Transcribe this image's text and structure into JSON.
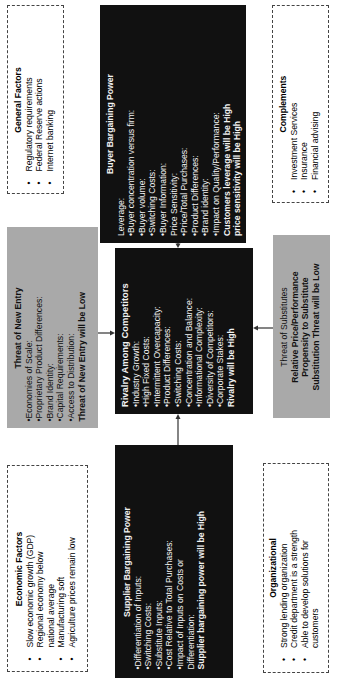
{
  "orientation": "rotated 90° clockwise; text reads bottom-to-top",
  "general_factors": {
    "title": "General Factors",
    "items": [
      "Regulatory requirements",
      "Federal Reserve actions",
      "Internet banking"
    ]
  },
  "buyer_power": {
    "title": "Buyer Bargaining Power",
    "lines": [
      "Leverage:",
      "•Buyer concentration versus firm:",
      "•Buyer volume:",
      "•Switching Costs:",
      "•Buyer Information:",
      "Price Sensitivity:",
      "•Price/Total Purchases:",
      "•Product Differences:",
      "•Brand identity:",
      "•Impact on Quality/Performance:"
    ],
    "conclusion_1": "Customers leverage will be High",
    "conclusion_2": "price sensitivity will be High"
  },
  "complements": {
    "title": "Complements",
    "items": [
      "Investment Services",
      "Insurance",
      "Financial advising"
    ]
  },
  "new_entry": {
    "title": "Threat of New Entry",
    "lines": [
      "•Economies of Scale:",
      "•Proprietary Product Differences:",
      "•Brand Identity:",
      "•Capital Requirements:",
      "•Access to Distribution:"
    ],
    "conclusion": "Threat of New Entry will be Low"
  },
  "rivalry": {
    "title": "Rivalry Among Competitors",
    "lines": [
      "•Industry Growth:",
      "•High Fixed Costs:",
      "•Intermittent Overcapacity:",
      "•Product Differences:",
      "•Switching Costs:",
      "•Concentration and Balance:",
      "•Informational Complexity:",
      "•Diversity of Competitors:",
      "•Corporate Stakes:"
    ],
    "conclusion": "Rivalry will be High"
  },
  "substitutes": {
    "title": "Threat of Substitutes",
    "line_1": "Relative Price/Performance",
    "line_2": "Propensity to Substitute",
    "conclusion": "Substitution Threat will be Low"
  },
  "economic_factors": {
    "title": "Economic Factors",
    "items": [
      "Slow economic growth (GDP)",
      "Regional economy below national average",
      "Manufacturing soft",
      "Agriculture prices remain low"
    ]
  },
  "supplier_power": {
    "title": "Supplier Bargaining Power",
    "lines": [
      "•Differentiation of Inputs:",
      "•Switching Costs:",
      "•Substitute Inputs:",
      "•Cost Relative to Total Purchases:",
      "•Impact of Inputs on Costs or",
      "Differentiation:"
    ],
    "conclusion": "Supplier bargaining power will be High"
  },
  "organizational": {
    "title": "Organizational",
    "items": [
      "Strong lending organization",
      "Credit department is a strength",
      "Able to develop solutions for customers"
    ]
  },
  "colors": {
    "black_box": "#111111",
    "grey_box": "#a9a9a9",
    "dashed_border": "#444444",
    "background": "#ffffff"
  }
}
